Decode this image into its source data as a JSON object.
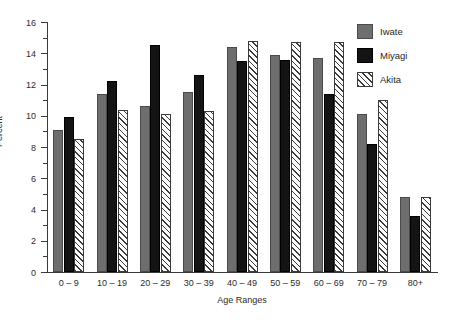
{
  "chart_data": {
    "type": "bar",
    "title": "",
    "xlabel": "Age Ranges",
    "ylabel": "Percent",
    "ylim": [
      0,
      16
    ],
    "ytick_step": 2,
    "yticks": [
      0,
      2,
      4,
      6,
      8,
      10,
      12,
      14,
      16
    ],
    "minor_tick_step": 1,
    "grid": false,
    "legend_position": "top-right",
    "categories": [
      "0 – 9",
      "10 – 19",
      "20 – 29",
      "30 – 39",
      "40 – 49",
      "50 – 59",
      "60 – 69",
      "70 – 79",
      "80+"
    ],
    "series": [
      {
        "name": "Iwate",
        "color": "#6e6e6e",
        "fill": "solid-gray",
        "values": [
          9.1,
          11.4,
          10.6,
          11.5,
          14.4,
          13.9,
          13.7,
          10.1,
          4.8
        ]
      },
      {
        "name": "Miyagi",
        "color": "#141414",
        "fill": "solid-black",
        "values": [
          9.9,
          12.2,
          14.5,
          12.6,
          13.5,
          13.6,
          11.4,
          8.2,
          3.6
        ]
      },
      {
        "name": "Akita",
        "color": "#ffffff",
        "fill": "diagonal-hatch",
        "values": [
          8.5,
          10.4,
          10.1,
          10.3,
          14.8,
          14.7,
          14.7,
          11.0,
          4.8
        ]
      }
    ]
  },
  "legend": {
    "items": [
      {
        "label": "Iwate"
      },
      {
        "label": "Miyagi"
      },
      {
        "label": "Akita"
      }
    ]
  }
}
